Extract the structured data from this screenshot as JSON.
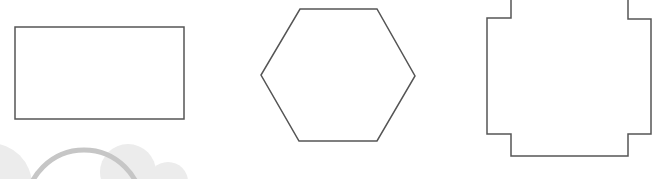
{
  "colors": {
    "background": "#ffffff",
    "outline": "#555555",
    "decor_fill": "#ececec",
    "decor_ring": "#c6c6c6"
  },
  "shapes": [
    {
      "name": "rectangle",
      "kind": "rect",
      "x": 15,
      "y": 27,
      "width": 169,
      "height": 92
    },
    {
      "name": "hexagon",
      "kind": "polygon",
      "points": "300,9 377,9 415,76 377,141 299,141 261,75"
    },
    {
      "name": "notched-square",
      "kind": "polygon",
      "points": "511,-2 511,18 487,18 487,134 511,134 511,156 628,156 628,134 651,134 651,19 628,19 628,-2"
    }
  ],
  "decorations": [
    {
      "name": "cloud-blob-left",
      "kind": "circle",
      "cx": -10,
      "cy": 185,
      "r": 42
    },
    {
      "name": "cloud-blob-mid",
      "kind": "circle",
      "cx": 128,
      "cy": 172,
      "r": 28
    },
    {
      "name": "cloud-blob-right",
      "kind": "circle",
      "cx": 168,
      "cy": 182,
      "r": 20
    },
    {
      "name": "ring-arc",
      "kind": "ring",
      "cx": 84,
      "cy": 208,
      "r": 58,
      "stroke_width": 5
    }
  ]
}
